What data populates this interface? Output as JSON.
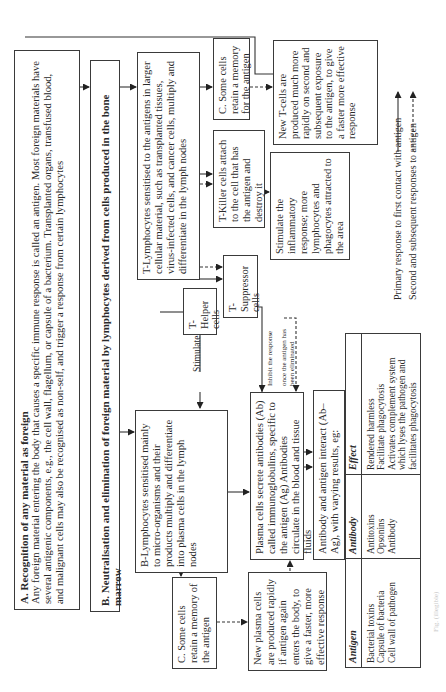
{
  "diagram": {
    "orientation": "rotated -90deg (reads bottom-to-top)",
    "section_a": {
      "title": "A. Recognition of any material as foreign",
      "body": "Any foreign material entering the body that causes a specific immune response is called an antigen. Most foreign materials have several antigenic components, e.g., the cell wall, flagellum, or capsule of a bacterium. Transplanted organs, transfused blood, and malignant cells may also be recognised as non-self, and trigger a response from certain lymphocytes"
    },
    "section_b": {
      "title": "B. Neutralisation and elimination of foreign material by lymphocytes derived from cells produced in the bone marrow"
    },
    "t_branch": {
      "t_lymphocytes": "T-Lymphocytes sensitised to the antigens in larger cellular material, such as transplanted tissues, virus-infected cells, and cancer cells, multiply and differentiate in the lymph nodes",
      "t_memory": "C. Some cells retain a memory for the antigen",
      "new_t_cells": "New T-cells are produced much more rapidly on second and subsequent exposure to the antigen, to give a faster more effective response",
      "t_killer": "T-Killer cells attach to the cell that has the antigen and destroy it",
      "inflammatory": "Stimulate the inflammatory response; more lymphocytes and phagocytes attracted to the area",
      "t_helper": "T-Helper cells",
      "t_suppressor": "T-Suppressor cells"
    },
    "b_branch": {
      "b_lymphocytes": "B-Lymphocytes sensitised mainly to micro-organisms and their products multiply and differentiate into plasma cells in the lymph nodes",
      "b_memory": "C. Some cells retain a memory of the antigen",
      "new_plasma": "New plasma cells are produced rapidly if antigen again enters the body, to give a faster, more effective response",
      "plasma_cells": "Plasma cells secrete antibodies (Ab) called immunoglobulins, specific to the antigen (Ag) Antibodies circulate in the blood and tissue fluids",
      "interaction": "Antibody and antigen interact (Ab–Ag), with varying results, eg:"
    },
    "labels": {
      "stimulate": "Stimulate",
      "inhibit": "Inhibit the response",
      "once_line1": "once the antigen has",
      "once_line2": "been eliminated"
    },
    "table": {
      "headers": [
        "Antigen",
        "Antibody",
        "Effect"
      ],
      "rows": [
        {
          "antigen": "Bacterial toxins",
          "antibody": "Antitoxins",
          "effect": "Rendered harmless"
        },
        {
          "antigen": "Capsule of bacteria",
          "antibody": "Opsonins",
          "effect": "Facilitate phagocytosis"
        },
        {
          "antigen": "Cell wall of pathogen",
          "antibody": "Antibody",
          "effect": "Activates complement system which lyses the pathogen and facilitates phagocytosis"
        }
      ]
    },
    "legend": {
      "solid": "Primary response to first contact with antigen",
      "dashed": "Second and subsequent responses to antigen"
    },
    "caption": "Fig. (illegible)"
  }
}
